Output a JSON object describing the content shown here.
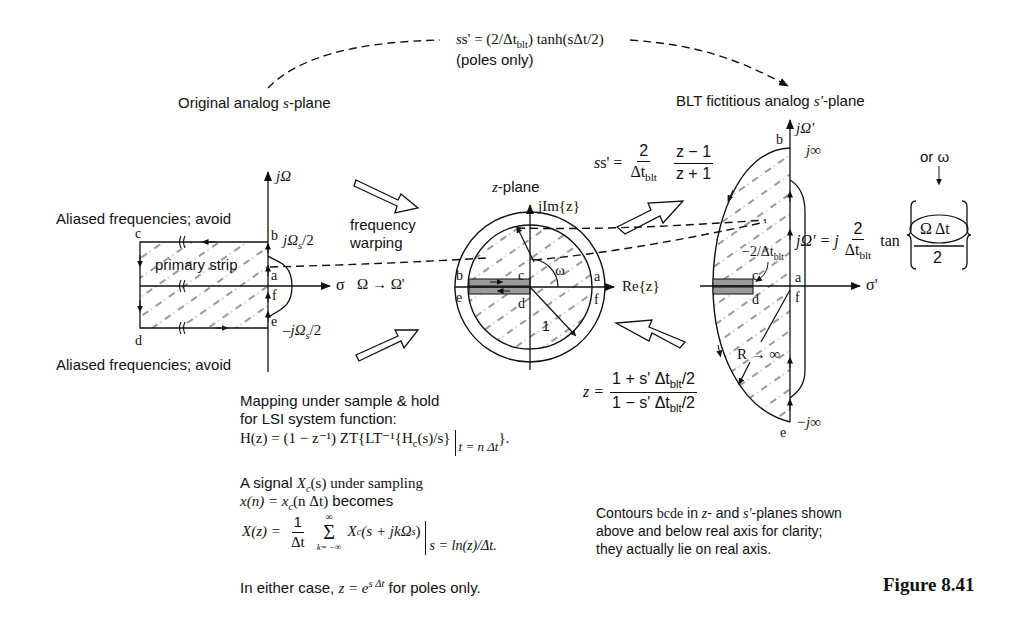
{
  "figure": {
    "number": "Figure 8.41",
    "top_mapping": {
      "formula_lhs": "s' = (2/Δt",
      "formula_sub": "blt",
      "formula_rhs": ") tanh(sΔt/2)",
      "note": "(poles only)"
    },
    "s_plane": {
      "title_pre": "Original analog ",
      "title_var": "s",
      "title_post": "-plane",
      "imag_axis": "jΩ",
      "real_axis": "σ",
      "aliased_top": "Aliased frequencies; avoid",
      "aliased_bottom": "Aliased frequencies; avoid",
      "strip_label": "primary strip",
      "upper_limit": "jΩ",
      "upper_limit_sub": "s",
      "upper_limit_post": "/2",
      "lower_limit": "–jΩ",
      "lower_limit_sub": "s",
      "lower_limit_post": "/2",
      "points": {
        "a": "a",
        "b": "b",
        "c": "c",
        "d": "d",
        "e": "e",
        "f": "f"
      }
    },
    "warping": {
      "line1": "frequency",
      "line2": "warping",
      "mapping": "Ω → Ω'"
    },
    "z_plane": {
      "title_var": "z",
      "title_post": "-plane",
      "imag_axis": "jIm{z}",
      "real_axis": "Re{z}",
      "angle": "ω",
      "radius": "1",
      "points": {
        "a": "a",
        "b": "b",
        "c": "c",
        "d": "d",
        "e": "e",
        "f": "f"
      }
    },
    "blt_forward": {
      "lhs": "s' =",
      "num1": "2",
      "den1": "Δt",
      "den1_sub": "blt",
      "num2": "z − 1",
      "den2": "z + 1"
    },
    "blt_inverse": {
      "lhs": "z =",
      "num": "1 + s' Δt",
      "num_sub": "blt",
      "num_post": "/2",
      "den": "1 − s' Δt",
      "den_sub": "blt",
      "den_post": "/2"
    },
    "s_prime_plane": {
      "title_pre": "BLT fictitious analog ",
      "title_var": "s'",
      "title_post": "-plane",
      "imag_axis": "jΩ'",
      "real_axis": "σ'",
      "top_inf": "j∞",
      "bottom_inf": "−j∞",
      "pole_label": "−2/Δt",
      "pole_label_sub": "blt",
      "radius_label": "R → ∞",
      "points": {
        "a": "a",
        "b": "b",
        "c": "c",
        "d": "d",
        "e": "e",
        "f": "f"
      },
      "warp_formula_lhs": "jΩ' = j",
      "warp_num": "2",
      "warp_den": "Δt",
      "warp_den_sub": "blt",
      "warp_tan": "tan",
      "warp_arg_num": "Ω Δt",
      "warp_arg_den": "2",
      "or_omega": "or ω"
    },
    "sample_hold": {
      "line1": "Mapping under sample & hold",
      "line2": "for LSI system function:",
      "formula": "H(z) = (1 − z⁻¹) ZT{LT⁻¹{H",
      "formula_sub": "c",
      "formula_post": "(s)/s}",
      "eval_at": "t = n Δt",
      "close": "}."
    },
    "sampling": {
      "line1_pre": "A signal ",
      "line1_var": "X",
      "line1_sub": "c",
      "line1_post": "(s) under sampling",
      "line2_pre": "x(n) = x",
      "line2_sub": "c",
      "line2_mid": "(n Δt)",
      "line2_post": " becomes",
      "lhs": "X(z) =",
      "num": "1",
      "den": "Δt",
      "sum_top": "∞",
      "sum_sym": "Σ",
      "sum_bot": "k= −∞",
      "term": "X",
      "term_sub": "c",
      "term_post": " (s + jkΩ",
      "term_sub2": "s",
      "term_close": ")",
      "eval_at": "s = ln(z)/Δt."
    },
    "either_case": {
      "pre": "In either case, ",
      "formula": "z = e",
      "exp": "s Δt",
      "post": " for poles only."
    },
    "contour_note": {
      "line1_pre": "Contours ",
      "line1_bcde": "bcde",
      "line1_mid": " in ",
      "line1_z": "z",
      "line1_mid2": "- and ",
      "line1_s": "s'",
      "line1_post": "-planes shown",
      "line2": "above and below real axis for clarity;",
      "line3": "they actually lie on real axis."
    }
  },
  "colors": {
    "ink": "#111111",
    "strip_fill": "#9a9a9a",
    "background": "#ffffff"
  }
}
